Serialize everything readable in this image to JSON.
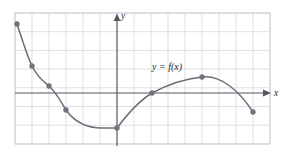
{
  "figure": {
    "name": "function-graph",
    "width": 282,
    "height": 157,
    "background_color": "#ffffff"
  },
  "labels": {
    "y_axis": "y",
    "x_axis": "x",
    "curve": "y = f(x)"
  },
  "colors": {
    "grid": "#d2d2d8",
    "grid_border": "#c2c2ca",
    "axis": "#555560",
    "curve": "#6e6e78",
    "point": "#737380",
    "text": "#2a2a2a"
  },
  "chart_data": {
    "type": "line",
    "title": "",
    "subtitle": "",
    "xlabel": "x",
    "ylabel": "y",
    "series_label": "y = f(x)",
    "grid": true,
    "legend_position": "inline-annotation",
    "annotations": [
      {
        "text": "y = f(x)",
        "px": 152,
        "py": 70
      }
    ],
    "axes": {
      "x_axis_py": 93,
      "y_axis_px": 117,
      "x_axis_arrow": true,
      "y_axis_arrow": true,
      "x_axis_extends_px": [
        15,
        266
      ],
      "y_axis_extends_py": [
        15,
        146
      ]
    },
    "grid_geometry": {
      "left_px": 15,
      "right_px": 270,
      "top_px": 13,
      "bottom_px": 144,
      "cell_w_px": 17,
      "cell_h_px": 18.7,
      "n_cols": 15,
      "n_rows": 7
    },
    "marked_points_px": [
      {
        "px": 17,
        "py": 24,
        "note": "left endpoint, high"
      },
      {
        "px": 32,
        "py": 66,
        "note": "descending"
      },
      {
        "px": 49,
        "py": 86,
        "note": "descending"
      },
      {
        "px": 66,
        "py": 110,
        "note": "descending"
      },
      {
        "px": 117,
        "py": 128,
        "note": "minimum at y-axis"
      },
      {
        "px": 152,
        "py": 93,
        "note": "x-axis crossing"
      },
      {
        "px": 202,
        "py": 77,
        "note": "local maximum"
      },
      {
        "px": 253,
        "py": 112,
        "note": "right endpoint"
      }
    ],
    "curve_path_px": "M 17,24 C 24,45 28,58 32,66 C 38,78 44,82 49,86 C 56,92 61,102 66,110 C 76,124 88,128 102,128 C 108,128 113,128 117,128 C 126,116 137,102 152,93 C 167,85 182,79 202,77 C 222,75 240,92 253,112"
  }
}
